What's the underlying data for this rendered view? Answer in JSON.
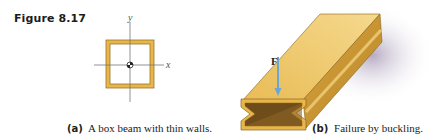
{
  "figure": {
    "label": "Figure 8.17",
    "panels": [
      {
        "tag": "(a)",
        "caption": "A box beam with thin walls.",
        "axes": {
          "x_label": "x",
          "y_label": "y"
        }
      },
      {
        "tag": "(b)",
        "caption": "Failure by buckling.",
        "force_label": "F"
      }
    ],
    "colors": {
      "beam_fill": "#e8b64a",
      "beam_light": "#f0cf7e",
      "beam_dark": "#b8862a",
      "beam_edge": "#8a6420",
      "force_arrow": "#6aa6d6",
      "shadow": "#b9aec6",
      "axis": "#777777"
    }
  }
}
